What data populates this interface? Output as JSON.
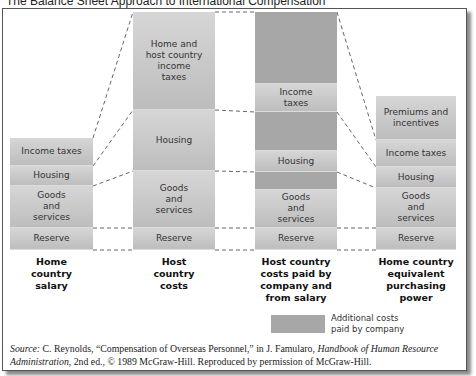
{
  "title": "The Balance Sheet Approach to International Compensation",
  "diagram": {
    "columns": [
      {
        "label": "Home country salary",
        "label_lines": [
          "Home",
          "country",
          "salary"
        ],
        "blocks": [
          {
            "text": "Income taxes",
            "type": "employee"
          },
          {
            "text": "Housing",
            "type": "employee"
          },
          {
            "text": "Goods and services",
            "type": "employee"
          },
          {
            "text": "Reserve",
            "type": "employee"
          }
        ]
      },
      {
        "label": "Host country costs",
        "label_lines": [
          "Host",
          "country",
          "costs"
        ],
        "blocks": [
          {
            "text": "Home and host country income taxes",
            "type": "employee"
          },
          {
            "text": "Housing",
            "type": "employee"
          },
          {
            "text": "Goods and services",
            "type": "employee"
          },
          {
            "text": "Reserve",
            "type": "employee"
          }
        ]
      },
      {
        "label": "Host country costs paid by company and from salary",
        "label_lines": [
          "Host country",
          "costs paid by",
          "company and",
          "from salary"
        ],
        "blocks": [
          {
            "text": "",
            "type": "company"
          },
          {
            "text": "Income taxes",
            "type": "employee"
          },
          {
            "text": "",
            "type": "company"
          },
          {
            "text": "Housing",
            "type": "employee"
          },
          {
            "text": "",
            "type": "company"
          },
          {
            "text": "Goods and services",
            "type": "employee"
          },
          {
            "text": "Reserve",
            "type": "employee"
          }
        ]
      },
      {
        "label": "Home country equivalent purchasing power",
        "label_lines": [
          "Home country",
          "equivalent",
          "purchasing",
          "power"
        ],
        "blocks": [
          {
            "text": "Premiums and incentives",
            "type": "employee"
          },
          {
            "text": "Income taxes",
            "type": "employee"
          },
          {
            "text": "Housing",
            "type": "employee"
          },
          {
            "text": "Goods and services",
            "type": "employee"
          },
          {
            "text": "Reserve",
            "type": "employee"
          }
        ]
      }
    ],
    "legend": {
      "text_line1": "Additional costs",
      "text_line2": "paid by company",
      "color": "#a7a7a7"
    },
    "colors": {
      "employee_block": "#c9c9c9",
      "company_block": "#a7a7a7",
      "connector": "#555555"
    }
  },
  "source": {
    "prefix": "Source:",
    "text1": " C. Reynolds, “Compensation of Overseas Personnel,” in J. Famularo, ",
    "book_title": "Handbook of Human Resource Administration",
    "text2": ", 2nd ed., © 1989 McGraw-Hill. Reproduced by permission of McGraw-Hill."
  }
}
